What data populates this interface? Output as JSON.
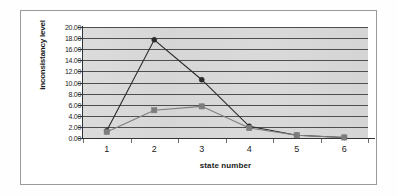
{
  "chart_data": {
    "type": "line",
    "title": "",
    "xlabel": "state number",
    "ylabel": "inconsistancy level",
    "categories": [
      "1",
      "2",
      "3",
      "4",
      "5",
      "6"
    ],
    "x": [
      1,
      2,
      3,
      4,
      5,
      6
    ],
    "ylim": [
      0.0,
      20.0
    ],
    "ytick_step": 2.0,
    "ytick_labels": [
      "20.00",
      "18.00",
      "16.00",
      "14.00",
      "12.00",
      "10.00",
      "8.00",
      "6.00",
      "4.00",
      "2.00",
      "0.00"
    ],
    "ytick_values": [
      20.0,
      18.0,
      16.0,
      14.0,
      12.0,
      10.0,
      8.0,
      6.0,
      4.0,
      2.0,
      0.0
    ],
    "grid": true,
    "grid_axis": "y",
    "legend": "none",
    "plot_background": "#d4d4d4",
    "series": [
      {
        "name": "series-1",
        "marker": "circle",
        "color": "#2a2a2a",
        "values": [
          1.3,
          17.7,
          10.5,
          2.1,
          0.5,
          0.1
        ]
      },
      {
        "name": "series-2",
        "marker": "square",
        "color": "#7d7d7d",
        "values": [
          1.1,
          5.0,
          5.7,
          1.8,
          0.5,
          0.1
        ]
      }
    ]
  },
  "figure": {
    "border_color": "#9a9a9a",
    "canvas_color": "#ffffff"
  }
}
